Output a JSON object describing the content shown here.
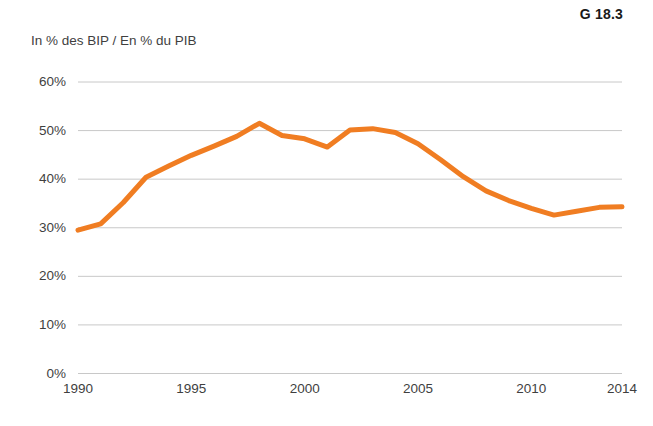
{
  "figure": {
    "number": "G 18.3"
  },
  "axis_title": "In % des BIP / En % du PIB",
  "chart_data": {
    "type": "line",
    "title": "",
    "subtitle": "",
    "xlabel": "",
    "ylabel": "In % des BIP / En % du PIB",
    "xlim": [
      1990,
      2014
    ],
    "ylim": [
      0,
      60
    ],
    "grid": true,
    "legend": false,
    "line_color": "#F07D22",
    "line_width": 5,
    "x_tick_labels": [
      "1990",
      "1995",
      "2000",
      "2005",
      "2010",
      "2014"
    ],
    "x_ticks": [
      1990,
      1995,
      2000,
      2005,
      2010,
      2014
    ],
    "y_tick_labels": [
      "0%",
      "10%",
      "20%",
      "30%",
      "40%",
      "50%",
      "60%"
    ],
    "y_ticks": [
      0,
      10,
      20,
      30,
      40,
      50,
      60
    ],
    "series": [
      {
        "name": "Schuldenquote / Taux d'endettement",
        "x": [
          1990,
          1991,
          1992,
          1993,
          1994,
          1995,
          1996,
          1997,
          1998,
          1999,
          2000,
          2001,
          2002,
          2003,
          2004,
          2005,
          2006,
          2007,
          2008,
          2009,
          2010,
          2011,
          2012,
          2013,
          2014
        ],
        "values": [
          29.5,
          30.8,
          35.2,
          40.4,
          42.7,
          44.9,
          46.8,
          48.8,
          51.5,
          49.0,
          48.3,
          46.6,
          50.1,
          50.4,
          49.6,
          47.3,
          44.0,
          40.5,
          37.6,
          35.6,
          34.0,
          32.6,
          33.4,
          34.2,
          34.3
        ]
      }
    ]
  }
}
